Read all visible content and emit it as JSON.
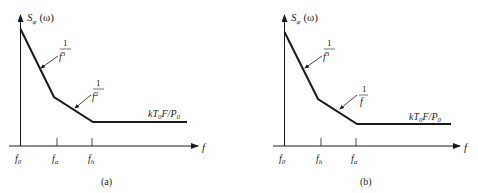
{
  "panels": [
    {
      "id": "a",
      "caption": "(a)",
      "y_axis_label": "S",
      "y_axis_sub": "φ",
      "y_axis_arg": "(ω)",
      "x_axis_label": "f",
      "ticks": [
        {
          "name": "f",
          "sub": "0"
        },
        {
          "name": "f",
          "sub": "α"
        },
        {
          "name": "f",
          "sub": "h"
        }
      ],
      "slope_labels": [
        {
          "num": "1",
          "den": "f",
          "exp": "3"
        },
        {
          "num": "1",
          "den": "f",
          "exp": "2"
        }
      ],
      "floor_label": {
        "k": "kT",
        "sub0": "0",
        "mid": "F/P",
        "sub1": "0"
      }
    },
    {
      "id": "b",
      "caption": "(b)",
      "y_axis_label": "S",
      "y_axis_sub": "φ",
      "y_axis_arg": "(ω)",
      "x_axis_label": "f",
      "ticks": [
        {
          "name": "f",
          "sub": "0"
        },
        {
          "name": "f",
          "sub": "h"
        },
        {
          "name": "f",
          "sub": "α"
        }
      ],
      "slope_labels": [
        {
          "num": "1",
          "den": "f",
          "exp": "3"
        },
        {
          "num": "1",
          "den": "f",
          "exp": ""
        }
      ],
      "floor_label": {
        "k": "kT",
        "sub0": "0",
        "mid": "F/P",
        "sub1": "0"
      }
    }
  ],
  "colors": {
    "line": "#1a1a1a",
    "text": "#222222",
    "background": "#ffffff"
  }
}
